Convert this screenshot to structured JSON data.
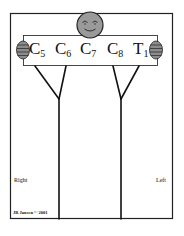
{
  "diagram": {
    "title": "",
    "roots": [
      {
        "letter": "C",
        "sub": "5"
      },
      {
        "letter": "C",
        "sub": "6"
      },
      {
        "letter": "C",
        "sub": "7"
      },
      {
        "letter": "C",
        "sub": "8"
      },
      {
        "letter": "T",
        "sub": "1"
      }
    ],
    "sides": {
      "right": "Right",
      "left": "Left"
    },
    "credit": "JR Jansen © 2001",
    "colors": {
      "line": "#111111",
      "face_fill": "#9a9a9a",
      "fist_fill": "#8c8c8c",
      "background": "#ffffff"
    },
    "icons": {
      "head": "smiley-face-icon",
      "left_hand": "fist-icon",
      "right_hand": "fist-icon"
    }
  }
}
